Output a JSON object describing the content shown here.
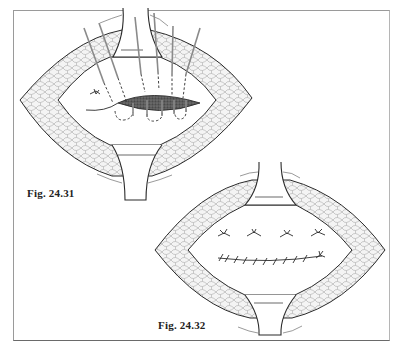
{
  "figures": [
    {
      "id": "fig-24-31",
      "caption": "Fig. 24.31",
      "description": "Incision held open by retractors; sutures passed through tissue around a dark stippled wound/defect",
      "suture_count": 5
    },
    {
      "id": "fig-24-32",
      "caption": "Fig. 24.32",
      "description": "Incision held open by retractors; interrupted knotted sutures above and a continuous running suture line below",
      "interrupted_sutures": 4,
      "running_suture_stitches": 10
    }
  ],
  "colors": {
    "line": "#2a2a2a",
    "fat_tissue_fill": "#f2f2f2",
    "fat_cell_stroke": "#9a9a9a",
    "suture": "#8a8a8a",
    "wound": "#4a4a4a",
    "frame": "#8c8c8c"
  }
}
